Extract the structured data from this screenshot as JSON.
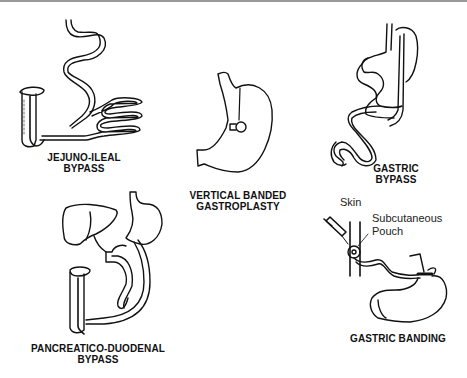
{
  "figure": {
    "type": "bariatric surgery procedures illustration",
    "panels": [
      {
        "id": "jejuno-ileal",
        "label_line1": "JEJUNO-ILEAL",
        "label_line2": "BYPASS"
      },
      {
        "id": "vbg",
        "label_line1": "VERTICAL BANDED",
        "label_line2": "GASTROPLASTY"
      },
      {
        "id": "gastric-bypass",
        "label_line1": "GASTRIC",
        "label_line2": "BYPASS"
      },
      {
        "id": "pancreatico-duodenal",
        "label_line1": "PANCREATICO-DUODENAL",
        "label_line2": "BYPASS"
      },
      {
        "id": "gastric-banding",
        "label_line1": "GASTRIC BANDING",
        "annotations": {
          "skin": "Skin",
          "pouch_line1": "Subcutaneous",
          "pouch_line2": "Pouch"
        }
      }
    ]
  },
  "colors": {
    "stroke": "#111111",
    "background": "#ffffff",
    "top_border": "#9a9a9a"
  }
}
